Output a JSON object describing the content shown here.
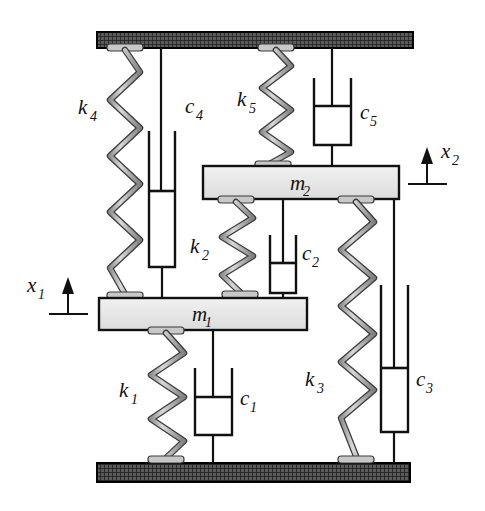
{
  "figure": {
    "colors": {
      "line": "#111111",
      "spring_fill": "#b5b5b5",
      "spring_stroke": "#1a1a1a",
      "mass_fill": "#e8e8e8",
      "ground_fill": "#4a4a4a",
      "ground_stroke": "#000000",
      "background": "#ffffff"
    }
  },
  "supports": {
    "ceiling": {
      "name": "ceiling-support",
      "hatch": "cross-hatch"
    },
    "ground": {
      "name": "ground-support",
      "hatch": "cross-hatch"
    }
  },
  "masses": [
    {
      "id": "m1",
      "label": "m",
      "sub": "1",
      "full": "m1"
    },
    {
      "id": "m2",
      "label": "m",
      "sub": "2",
      "full": "m2"
    }
  ],
  "springs": [
    {
      "id": "k1",
      "label": "k",
      "sub": "1",
      "full": "k1",
      "from": "m1",
      "to": "ground"
    },
    {
      "id": "k2",
      "label": "k",
      "sub": "2",
      "full": "k2",
      "from": "m2",
      "to": "m1"
    },
    {
      "id": "k3",
      "label": "k",
      "sub": "3",
      "full": "k3",
      "from": "m2",
      "to": "ground"
    },
    {
      "id": "k4",
      "label": "k",
      "sub": "4",
      "full": "k4",
      "from": "ceiling",
      "to": "m1"
    },
    {
      "id": "k5",
      "label": "k",
      "sub": "5",
      "full": "k5",
      "from": "ceiling",
      "to": "m2"
    }
  ],
  "dampers": [
    {
      "id": "c1",
      "label": "c",
      "sub": "1",
      "full": "c1",
      "from": "m1",
      "to": "ground"
    },
    {
      "id": "c2",
      "label": "c",
      "sub": "2",
      "full": "c2",
      "from": "m2",
      "to": "m1"
    },
    {
      "id": "c3",
      "label": "c",
      "sub": "3",
      "full": "c3",
      "from": "m2",
      "to": "ground"
    },
    {
      "id": "c4",
      "label": "c",
      "sub": "4",
      "full": "c4",
      "from": "ceiling",
      "to": "m1"
    },
    {
      "id": "c5",
      "label": "c",
      "sub": "5",
      "full": "c5",
      "from": "ceiling",
      "to": "m2"
    }
  ],
  "coordinates": [
    {
      "id": "x1",
      "label": "x",
      "sub": "1",
      "full": "x1",
      "mass": "m1",
      "direction": "up"
    },
    {
      "id": "x2",
      "label": "x",
      "sub": "2",
      "full": "x2",
      "mass": "m2",
      "direction": "up"
    }
  ]
}
